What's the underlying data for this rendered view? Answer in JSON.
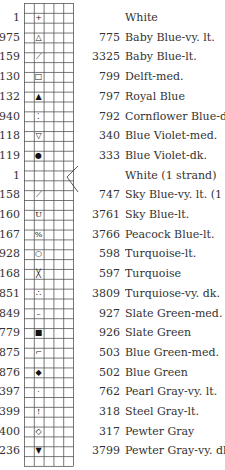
{
  "legend": {
    "title": "",
    "entries": [
      {
        "left": "1",
        "right": "",
        "name": "White",
        "symbol": "plus-icon",
        "glyph": "+"
      },
      {
        "left": "975",
        "right": "775",
        "name": "Baby Blue-vy. lt.",
        "symbol": "triangle-outline-icon",
        "glyph": "△"
      },
      {
        "left": "159",
        "right": "3325",
        "name": "Baby Blue-lt.",
        "symbol": "diagonal-dash-icon",
        "glyph": "⟋"
      },
      {
        "left": "130",
        "right": "799",
        "name": "Delft-med.",
        "symbol": "square-outline-icon",
        "glyph": "□"
      },
      {
        "left": "132",
        "right": "797",
        "name": "Royal Blue",
        "symbol": "small-triangle-icon",
        "glyph": "▲"
      },
      {
        "left": "940",
        "right": "792",
        "name": "Cornflower Blue-dk.",
        "symbol": "dots-icon",
        "glyph": "⁚"
      },
      {
        "left": "118",
        "right": "340",
        "name": "Blue Violet-med.",
        "symbol": "triangle-down-outline-icon",
        "glyph": "▽"
      },
      {
        "left": "119",
        "right": "333",
        "name": "Blue Violet-dk.",
        "symbol": "filled-circle-icon",
        "glyph": "●"
      },
      {
        "left": "1",
        "right": "",
        "name": "White (1 strand)",
        "symbol": "",
        "glyph": ""
      },
      {
        "left": "158",
        "right": "747",
        "name": "Sky Blue-vy. lt. (1 strand)",
        "symbol": "blended-diagonal-icon",
        "glyph": "⟋"
      },
      {
        "left": "160",
        "right": "3761",
        "name": "Sky Blue-lt.",
        "symbol": "u-icon",
        "glyph": "U"
      },
      {
        "left": "167",
        "right": "3766",
        "name": "Peacock Blue-lt.",
        "symbol": "percent-icon",
        "glyph": "%"
      },
      {
        "left": "928",
        "right": "598",
        "name": "Turquoise-lt.",
        "symbol": "circle-outline-icon",
        "glyph": "○"
      },
      {
        "left": "168",
        "right": "597",
        "name": "Turquoise",
        "symbol": "x-icon",
        "glyph": "╳"
      },
      {
        "left": "851",
        "right": "3809",
        "name": "Turquiose-vy. dk.",
        "symbol": "three-dots-icon",
        "glyph": "∴"
      },
      {
        "left": "849",
        "right": "927",
        "name": "Slate Green-med.",
        "symbol": "dash-icon",
        "glyph": "–"
      },
      {
        "left": "779",
        "right": "926",
        "name": "Slate Green",
        "symbol": "filled-square-icon",
        "glyph": "■"
      },
      {
        "left": "875",
        "right": "503",
        "name": "Blue Green-med.",
        "symbol": "corner-dot-icon",
        "glyph": "⌐"
      },
      {
        "left": "876",
        "right": "502",
        "name": "Blue Green",
        "symbol": "filled-diamond-icon",
        "glyph": "◆"
      },
      {
        "left": "397",
        "right": "762",
        "name": "Pearl Gray-vy. lt.",
        "symbol": "dot-icon",
        "glyph": "·"
      },
      {
        "left": "399",
        "right": "318",
        "name": "Steel Gray-lt.",
        "symbol": "exclamation-icon",
        "glyph": "!"
      },
      {
        "left": "400",
        "right": "317",
        "name": "Pewter Gray",
        "symbol": "diamond-outline-icon",
        "glyph": "◇"
      },
      {
        "left": "236",
        "right": "3799",
        "name": "Pewter Gray-vy. dk.",
        "symbol": "triangle-down-filled-icon",
        "glyph": "▼"
      }
    ]
  },
  "colors": {
    "grid": "#555555",
    "text": "#333333",
    "symbol": "#111111"
  }
}
